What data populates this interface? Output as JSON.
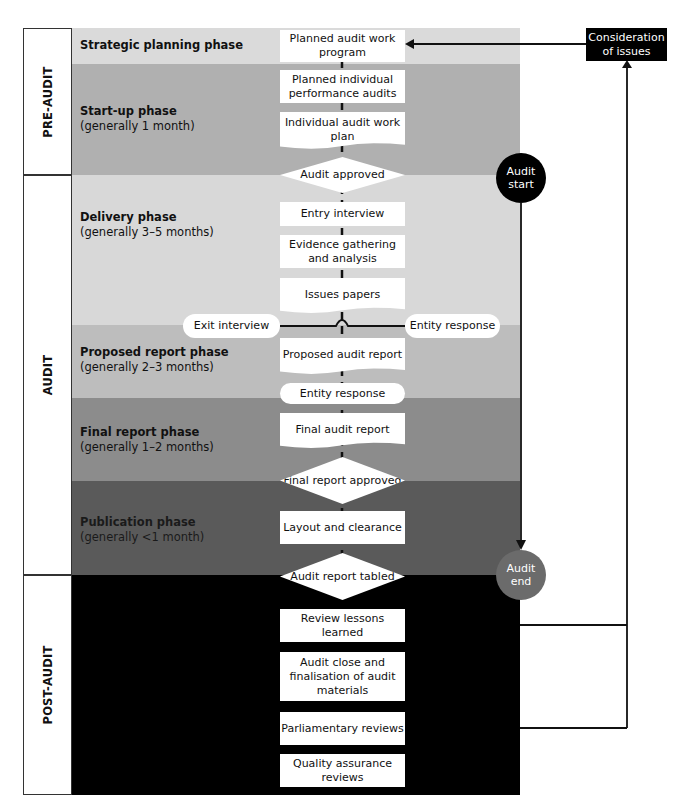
{
  "stages": {
    "pre_audit": "PRE-AUDIT",
    "audit": "AUDIT",
    "post_audit": "POST-AUDIT"
  },
  "phases": [
    {
      "title": "Strategic planning phase",
      "subtitle": "",
      "color": "#dadada"
    },
    {
      "title": "Start-up phase",
      "subtitle": "(generally 1 month)",
      "color": "#b0b0b0"
    },
    {
      "title": "Delivery phase",
      "subtitle": "(generally 3–5 months)",
      "color": "#d8d8d8"
    },
    {
      "title": "Proposed report phase",
      "subtitle": "(generally 2–3 months)",
      "color": "#bdbdbd"
    },
    {
      "title": "Final report phase",
      "subtitle": "(generally 1–2 months)",
      "color": "#8c8c8c"
    },
    {
      "title": "Publication phase",
      "subtitle": "(generally <1 month)",
      "color": "#5a5a5a"
    },
    {
      "title": "",
      "subtitle": "",
      "color": "#000000"
    }
  ],
  "nodes": {
    "planned_work_program": "Planned audit work program",
    "planned_individual": "Planned individual performance audits",
    "individual_plan": "Individual audit work plan",
    "audit_approved": "Audit approved",
    "entry_interview": "Entry interview",
    "evidence": "Evidence gathering and analysis",
    "issues_papers": "Issues papers",
    "exit_interview": "Exit interview",
    "entity_response_side": "Entity response",
    "proposed_report": "Proposed audit report",
    "entity_response": "Entity response",
    "final_report": "Final audit report",
    "final_approved": "Final report approved",
    "layout": "Layout and clearance",
    "tabled": "Audit report tabled",
    "review_lessons": "Review lessons learned",
    "close": "Audit close and finalisation of audit materials",
    "parliamentary": "Parliamentary reviews",
    "qa": "Quality assurance reviews"
  },
  "markers": {
    "audit_start": "Audit start",
    "audit_end": "Audit end",
    "consideration": "Consideration of issues"
  },
  "colors": {
    "start_circle": "#000000",
    "end_circle": "#6b6b6b"
  }
}
